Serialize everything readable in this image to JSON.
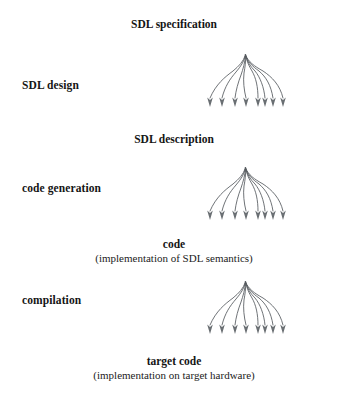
{
  "diagram": {
    "background_color": "#ffffff",
    "text_color": "#151515",
    "tree_stroke_color": "#555a5e",
    "stages": [
      {
        "process_label": "SDL design",
        "input_label": "SDL specification",
        "output_label": "SDL description",
        "output_caption": ""
      },
      {
        "process_label": "code generation",
        "input_label": "SDL description",
        "output_label": "code",
        "output_caption": "(implementation of SDL semantics)"
      },
      {
        "process_label": "compilation",
        "input_label": "code",
        "output_label": "target code",
        "output_caption": "(implementation on target hardware)"
      }
    ],
    "labels": {
      "sdl_specification": "SDL specification",
      "sdl_design": "SDL design",
      "sdl_description": "SDL description",
      "code_generation": "code generation",
      "code": "code",
      "code_caption": "(implementation of SDL semantics)",
      "compilation": "compilation",
      "target_code": "target code",
      "target_code_caption": "(implementation on target hardware)"
    },
    "tree": {
      "leaf_count": 8,
      "description": "branching tree with arrowheads at leaves"
    }
  }
}
